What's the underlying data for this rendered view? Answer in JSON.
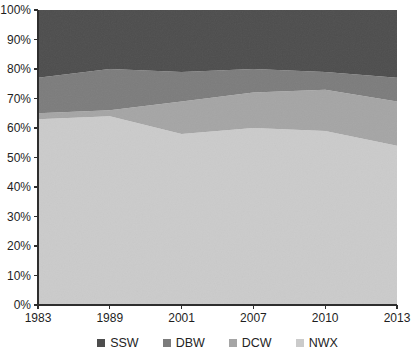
{
  "chart_data": {
    "type": "area",
    "stacked": true,
    "percent_stacked": true,
    "title": "",
    "xlabel": "",
    "ylabel": "",
    "categories": [
      "1983",
      "1989",
      "2001",
      "2007",
      "2010",
      "2013"
    ],
    "series": [
      {
        "name": "NWX",
        "values": [
          63,
          64,
          58,
          60,
          59,
          54
        ],
        "color": "#cbcbcb"
      },
      {
        "name": "DCW",
        "values": [
          2,
          2,
          11,
          12,
          14,
          15
        ],
        "color": "#a5a5a5"
      },
      {
        "name": "DBW",
        "values": [
          12,
          14,
          10,
          8,
          6,
          8
        ],
        "color": "#7c7c7c"
      },
      {
        "name": "SSW",
        "values": [
          23,
          20,
          21,
          20,
          21,
          23
        ],
        "color": "#4d4d4d"
      }
    ],
    "cumulative_tops": {
      "NWX": [
        63,
        64,
        58,
        60,
        59,
        54
      ],
      "DCW": [
        65,
        66,
        69,
        72,
        73,
        69
      ],
      "DBW": [
        77,
        80,
        79,
        80,
        79,
        77
      ],
      "SSW": [
        100,
        100,
        100,
        100,
        100,
        100
      ]
    },
    "ylim": [
      0,
      100
    ],
    "y_ticks": [
      "0%",
      "10%",
      "20%",
      "30%",
      "40%",
      "50%",
      "60%",
      "70%",
      "80%",
      "90%",
      "100%"
    ],
    "grid": false,
    "legend": {
      "position": "bottom",
      "order": [
        "SSW",
        "DBW",
        "DCW",
        "NWX"
      ]
    },
    "colors": {
      "axis": "#2e2e2e",
      "tick_text": "#1e1e1e",
      "background": "#ffffff"
    }
  }
}
